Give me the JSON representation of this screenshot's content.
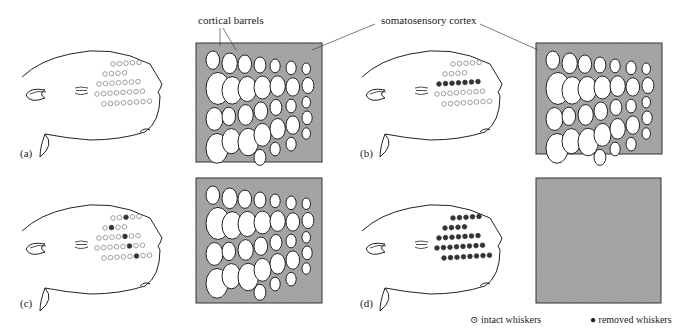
{
  "figure": {
    "annotations": {
      "cortical_barrels": "cortical barrels",
      "somatosensory_cortex": "somatosensory cortex"
    },
    "panels": [
      {
        "label": "(a)",
        "condition": "all whiskers intact",
        "cortex": "normal barrel map"
      },
      {
        "label": "(b)",
        "condition": "middle row removed",
        "cortex": "row of barrels shrunk, neighbors enlarged"
      },
      {
        "label": "(c)",
        "condition": "one column removed",
        "cortex": "column of barrels shrunk"
      },
      {
        "label": "(d)",
        "condition": "all whiskers removed",
        "cortex": "no barrels"
      }
    ],
    "legend": {
      "intact": "intact whiskers",
      "removed": "removed whiskers",
      "intact_symbol": "⊙",
      "removed_symbol": "●"
    },
    "colors": {
      "cortex_fill": "#a8a8a8",
      "barrel_fill": "#ffffff",
      "outline": "#222222",
      "intact_whisker": "#888888",
      "removed_whisker": "#333333"
    }
  }
}
